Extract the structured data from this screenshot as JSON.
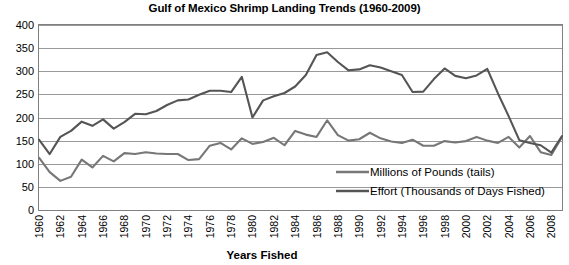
{
  "chart_data": {
    "type": "line",
    "title": "Gulf of Mexico Shrimp Landing Trends (1960-2009)",
    "xlabel": "Years Fished",
    "ylabel": "",
    "ylim": [
      0,
      400
    ],
    "ytick_step": 50,
    "yticks": [
      "0",
      "50",
      "100",
      "150",
      "200",
      "250",
      "300",
      "350",
      "400"
    ],
    "grid": true,
    "legend_position": "inside-bottom-right",
    "xticks": [
      "1960",
      "1962",
      "1964",
      "1966",
      "1968",
      "1970",
      "1972",
      "1974",
      "1976",
      "1978",
      "1980",
      "1982",
      "1984",
      "1986",
      "1988",
      "1990",
      "1992",
      "1994",
      "1996",
      "1998",
      "2000",
      "2002",
      "2004",
      "2006",
      "2008"
    ],
    "x": [
      1960,
      1961,
      1962,
      1963,
      1964,
      1965,
      1966,
      1967,
      1968,
      1969,
      1970,
      1971,
      1972,
      1973,
      1974,
      1975,
      1976,
      1977,
      1978,
      1979,
      1980,
      1981,
      1982,
      1983,
      1984,
      1985,
      1986,
      1987,
      1988,
      1989,
      1990,
      1991,
      1992,
      1993,
      1994,
      1995,
      1996,
      1997,
      1998,
      1999,
      2000,
      2001,
      2002,
      2003,
      2004,
      2005,
      2006,
      2007,
      2008,
      2009
    ],
    "series": [
      {
        "name": "Millions of Pounds (tails)",
        "color": "#777777",
        "values": [
          113,
          82,
          63,
          72,
          109,
          92,
          117,
          105,
          123,
          121,
          125,
          122,
          121,
          121,
          108,
          110,
          139,
          145,
          131,
          155,
          143,
          147,
          156,
          140,
          171,
          163,
          158,
          194,
          162,
          150,
          153,
          167,
          155,
          148,
          145,
          152,
          139,
          139,
          149,
          146,
          149,
          158,
          150,
          145,
          158,
          135,
          160,
          125,
          119,
          158
        ]
      },
      {
        "name": "Effort (Thousands of Days Fished)",
        "color": "#555555",
        "values": [
          152,
          121,
          158,
          171,
          191,
          182,
          196,
          176,
          190,
          208,
          207,
          214,
          227,
          237,
          239,
          249,
          258,
          258,
          255,
          288,
          200,
          237,
          246,
          253,
          267,
          292,
          335,
          341,
          320,
          302,
          304,
          313,
          308,
          300,
          292,
          255,
          256,
          283,
          306,
          290,
          285,
          291,
          305,
          252,
          203,
          151,
          145,
          140,
          124,
          160
        ]
      }
    ]
  }
}
